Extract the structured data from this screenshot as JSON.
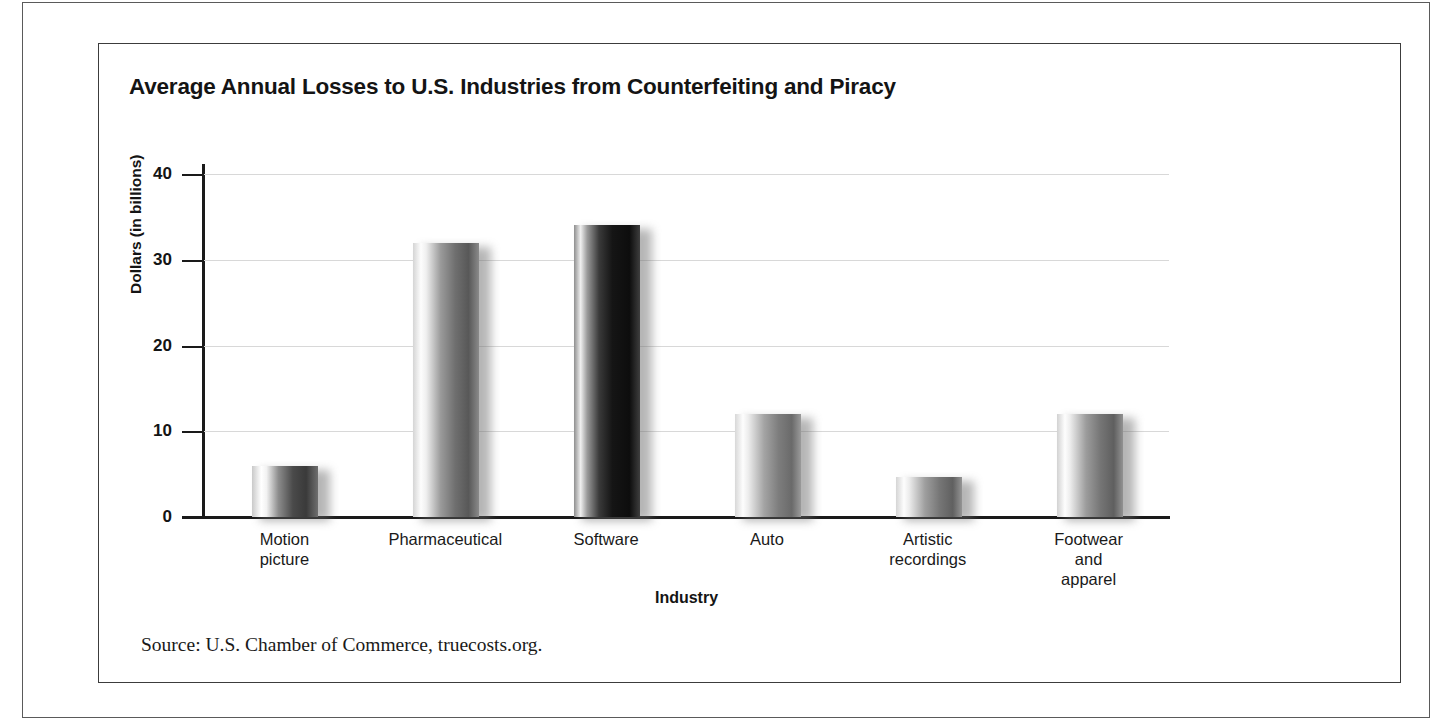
{
  "figure": {
    "title": "Average Annual Losses to U.S. Industries from Counterfeiting and Piracy",
    "source_note": "Source: U.S. Chamber of Commerce, truecosts.org."
  },
  "chart_data": {
    "type": "bar",
    "title": "Average Annual Losses to U.S. Industries from Counterfeiting and Piracy",
    "xlabel": "Industry",
    "ylabel": "Dollars (in billions)",
    "categories": [
      "Motion\npicture",
      "Pharmaceutical",
      "Software",
      "Auto",
      "Artistic\nrecordings",
      "Footwear\nand apparel"
    ],
    "values": [
      6,
      32,
      34,
      12,
      4.7,
      12
    ],
    "ylim": [
      0,
      40
    ],
    "yticks": [
      0,
      10,
      20,
      30,
      40
    ],
    "ytick_labels": [
      "0",
      "10",
      "20",
      "30",
      "40"
    ],
    "grid": "horizontal",
    "legend": "none",
    "bar_styles": [
      "light-left-dark-right",
      "light-left-medium-right",
      "very-dark",
      "light-left-medium-right",
      "light-left-medium-right",
      "light-left-medium-right"
    ]
  },
  "colors": {
    "background": "#ffffff",
    "text": "#141414",
    "axis": "#1a1a1a",
    "gridline": "#d8d8d8",
    "frame": "#5a5a5a"
  }
}
